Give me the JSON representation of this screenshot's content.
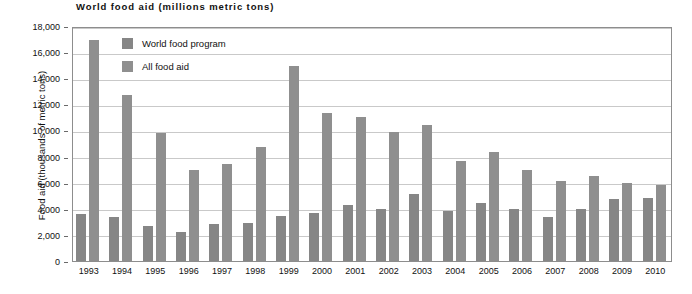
{
  "chart_data": {
    "type": "bar",
    "title": "World food aid (millions metric tons)",
    "xlabel": "",
    "ylabel": "Food aid (thousands of metric tons)",
    "ylim": [
      0,
      18000
    ],
    "yticks": [
      0,
      2000,
      4000,
      6000,
      8000,
      10000,
      12000,
      14000,
      16000,
      18000
    ],
    "ytick_labels": [
      "0",
      "2,000",
      "4,000",
      "6,000",
      "8,000",
      "10,000",
      "12,000",
      "14,000",
      "16,000",
      "18,000"
    ],
    "grid": true,
    "legend_position": "inside-top-left",
    "categories": [
      "1993",
      "1994",
      "1995",
      "1996",
      "1997",
      "1998",
      "1999",
      "2000",
      "2001",
      "2002",
      "2003",
      "2004",
      "2005",
      "2006",
      "2007",
      "2008",
      "2009",
      "2010"
    ],
    "series": [
      {
        "name": "World food program",
        "color": "#868686",
        "values": [
          3600,
          3400,
          2650,
          2250,
          2850,
          2900,
          3450,
          3700,
          4300,
          3950,
          5100,
          3800,
          4450,
          3950,
          3350,
          3950,
          4750,
          4800
        ]
      },
      {
        "name": "All food aid",
        "color": "#8f8f8f",
        "values": [
          16900,
          12700,
          9800,
          7000,
          7400,
          8750,
          14950,
          11350,
          11050,
          9900,
          10400,
          7650,
          8350,
          7000,
          6150,
          6500,
          5950,
          5800
        ]
      }
    ]
  },
  "legend": {
    "items": [
      {
        "label": "World food program",
        "color": "#868686"
      },
      {
        "label": "All food aid",
        "color": "#8f8f8f"
      }
    ]
  }
}
